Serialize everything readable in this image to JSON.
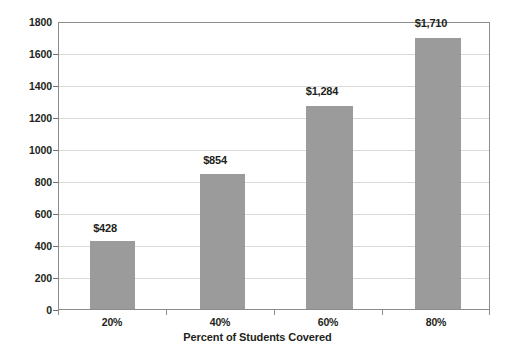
{
  "chart_data": {
    "type": "bar",
    "title": "",
    "xlabel": "Percent of Students Covered",
    "ylabel": "",
    "categories": [
      "20%",
      "40%",
      "60%",
      "80%"
    ],
    "values": [
      428,
      854,
      1284,
      1710
    ],
    "data_labels": [
      "$428",
      "$854",
      "$1,284",
      "$1,710"
    ],
    "ylim": [
      0,
      1800
    ],
    "ytick_step": 200,
    "ytick_labels": [
      "1800",
      "1600",
      "1400",
      "1200",
      "1000",
      "800",
      "600",
      "400",
      "200",
      "0"
    ],
    "ytick_values": [
      1800,
      1600,
      1400,
      1200,
      1000,
      800,
      600,
      400,
      200,
      0
    ],
    "grid": true,
    "legend": "none",
    "series": [
      {
        "name": "Cost per Student",
        "values": [
          428,
          854,
          1284,
          1710
        ],
        "color": "#9b9b9b"
      }
    ]
  },
  "colors": {
    "bar_fill": "#9b9b9b",
    "gridline": "#d9d9d9",
    "axis_line": "#8c8c8c",
    "text": "#231f20",
    "plot_background": "#ffffff"
  }
}
